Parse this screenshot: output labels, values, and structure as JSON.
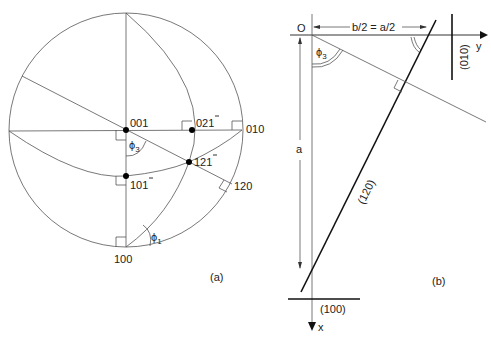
{
  "panel_a": {
    "caption": "(a)",
    "poles": {
      "p001": "001",
      "p021": "021",
      "p010": "010",
      "p121": "121",
      "p101": "101",
      "p120": "120",
      "p100": "100"
    },
    "angles": {
      "phi3": "ϕ",
      "phi3_sub": "3",
      "phi1": "ϕ",
      "phi1_sub": "1"
    },
    "bar_note": "Indices 021, 121, 101 carry an overbar on the last digit (l̄)"
  },
  "panel_b": {
    "caption": "(b)",
    "origin": "O",
    "y_axis": "y",
    "x_axis": "x",
    "dim_a": "a",
    "dim_top": "b/2 = a/2",
    "phi3": "ϕ",
    "phi3_sub": "3",
    "plane_120": "(120)",
    "plane_100": "(100)",
    "plane_010": "(010)"
  }
}
